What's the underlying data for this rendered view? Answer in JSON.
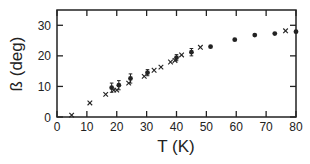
{
  "chart_data": {
    "type": "scatter",
    "title": "",
    "xlabel": "T (K)",
    "ylabel": "ß (deg)",
    "xlim": [
      0,
      80
    ],
    "ylim": [
      0,
      35
    ],
    "xticks": [
      0,
      10,
      20,
      30,
      40,
      50,
      60,
      70,
      80
    ],
    "yticks": [
      0,
      10,
      20,
      30
    ],
    "grid": false,
    "legend": null,
    "series": [
      {
        "name": "crosses",
        "marker": "x",
        "points": [
          {
            "x": 4.9,
            "y": 0.6
          },
          {
            "x": 11.0,
            "y": 4.6
          },
          {
            "x": 16.3,
            "y": 7.4
          },
          {
            "x": 19.0,
            "y": 8.8
          },
          {
            "x": 20.0,
            "y": 8.8
          },
          {
            "x": 24.0,
            "y": 11.1
          },
          {
            "x": 29.2,
            "y": 13.3
          },
          {
            "x": 32.5,
            "y": 15.3
          },
          {
            "x": 34.8,
            "y": 16.3
          },
          {
            "x": 38.0,
            "y": 18.0
          },
          {
            "x": 39.5,
            "y": 18.5
          },
          {
            "x": 41.7,
            "y": 20.3
          },
          {
            "x": 48.0,
            "y": 22.8
          },
          {
            "x": 76.5,
            "y": 28.2
          }
        ]
      },
      {
        "name": "dots",
        "marker": "filled-circle",
        "points": [
          {
            "x": 18.3,
            "y": 9.6,
            "err": 1.5
          },
          {
            "x": 20.7,
            "y": 10.4,
            "err": 1.5
          },
          {
            "x": 24.6,
            "y": 12.6,
            "err": 1.5
          },
          {
            "x": 30.3,
            "y": 14.5,
            "err": 1.0
          },
          {
            "x": 40.0,
            "y": 19.4,
            "err": 1.0
          },
          {
            "x": 45.0,
            "y": 21.2,
            "err": 1.2
          },
          {
            "x": 51.4,
            "y": 23.0,
            "err": 0
          },
          {
            "x": 59.5,
            "y": 25.3,
            "err": 0
          },
          {
            "x": 66.2,
            "y": 26.8,
            "err": 0
          },
          {
            "x": 72.9,
            "y": 27.3,
            "err": 0
          },
          {
            "x": 80.0,
            "y": 27.9,
            "err": 0
          }
        ]
      }
    ]
  }
}
